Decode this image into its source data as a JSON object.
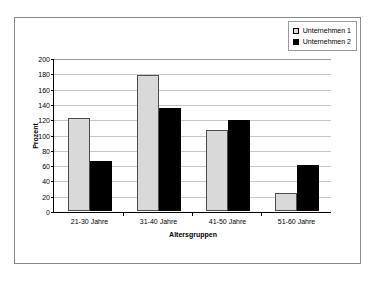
{
  "chart_data": {
    "type": "bar",
    "title": "",
    "xlabel": "Altersgruppen",
    "ylabel": "Prozent",
    "categories": [
      "21-30 Jahre",
      "31-40 Jahre",
      "41-50 Jahre",
      "51-60 Jahre"
    ],
    "series": [
      {
        "name": "Unternehmen 1",
        "color": "#d9d9d9",
        "values": [
          123,
          179,
          106,
          24
        ]
      },
      {
        "name": "Unternehmen 2",
        "color": "#000000",
        "values": [
          66,
          135,
          120,
          60
        ]
      }
    ],
    "ylim": [
      0,
      200
    ],
    "ytick_step": 20,
    "yticks": [
      "200",
      "180",
      "160",
      "140",
      "120",
      "100",
      "80",
      "60",
      "40",
      "20",
      "0"
    ],
    "grid": true,
    "legend_position": "top-right"
  },
  "legend": {
    "items": [
      {
        "label": "Unternehmen 1"
      },
      {
        "label": "Unternehmen 2"
      }
    ]
  }
}
